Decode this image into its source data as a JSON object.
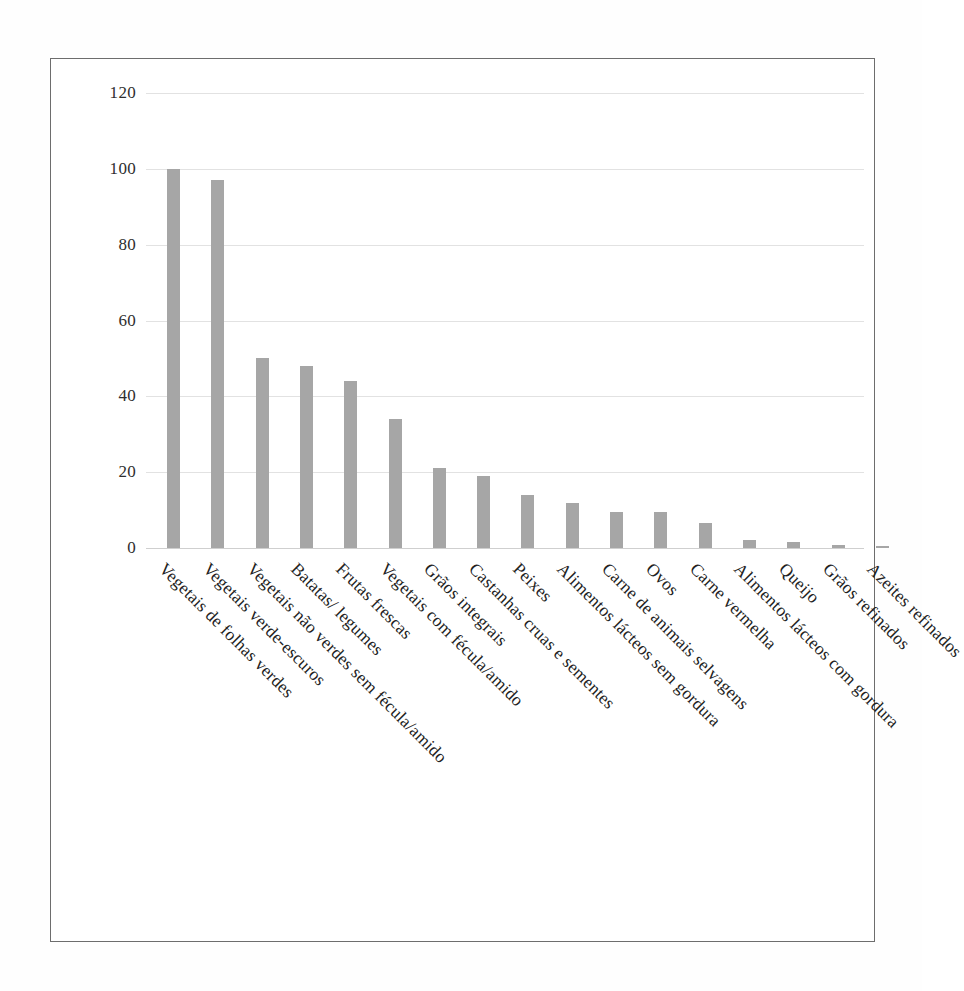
{
  "figure": {
    "frame_color": "#6d6d6d",
    "background": "#ffffff",
    "bar_color": "#a6a6a6",
    "gridline_color": "#e2e2e2"
  },
  "chart_data": {
    "type": "bar",
    "title": "",
    "subtitle": "",
    "xlabel": "",
    "ylabel": "",
    "ylim": [
      0,
      120
    ],
    "yticks": [
      0,
      20,
      40,
      60,
      80,
      100,
      120
    ],
    "ytick_labels": [
      "0",
      "20",
      "40",
      "60",
      "80",
      "100",
      "120"
    ],
    "grid": true,
    "legend": false,
    "legend_position": "none",
    "orientation": "vertical",
    "label_rotation": 45,
    "categories": [
      "Vegetais de folhas verdes",
      "Vegetais verde-escuros",
      "Vegetais não verdes sem fécula/amido",
      "Batatas/ legumes",
      "Frutas frescas",
      "Vegetais com fécula/amido",
      "Grãos integrais",
      "Castanhas cruas e sementes",
      "Peixes",
      "Alimentos lácteos sem gordura",
      "Carne de animais selvagens",
      "Ovos",
      "Carne vermelha",
      "Alimentos lácteos com gordura",
      "Queijo",
      "Grãos refinados",
      "Azeites refinados"
    ],
    "values": [
      100,
      97,
      50,
      48,
      44,
      34,
      21,
      19,
      14,
      12,
      9.6,
      9.5,
      6.5,
      2.2,
      1.5,
      0.8,
      0.4
    ]
  }
}
